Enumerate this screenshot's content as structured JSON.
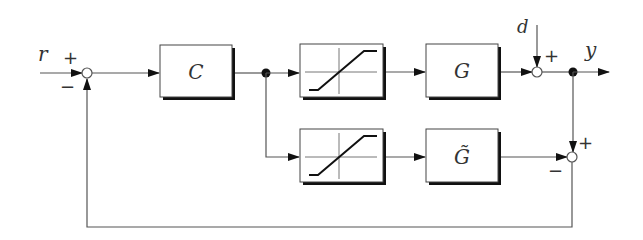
{
  "diagram": {
    "type": "block-diagram",
    "signals": {
      "reference": "r",
      "disturbance": "d",
      "output": "y"
    },
    "blocks": {
      "controller": "C",
      "saturation_top": "saturation",
      "plant": "G",
      "saturation_bottom": "saturation",
      "model": "G̃"
    },
    "summing_junctions": {
      "sum_reference": {
        "plus": "+",
        "minus": "−"
      },
      "sum_disturbance": {
        "plus": "+"
      },
      "sum_model_error": {
        "plus": "+",
        "minus": "−"
      }
    },
    "colors": {
      "line": "#555555",
      "box_border": "#444444",
      "shadow": "#111111",
      "text": "#333333"
    }
  }
}
